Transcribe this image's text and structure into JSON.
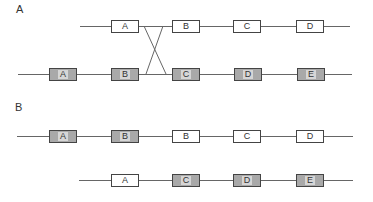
{
  "sections": [
    {
      "label": "A",
      "rows": [
        {
          "y": 26,
          "line": [
            80,
            350
          ],
          "boxes": [
            {
              "x": 111,
              "label": "A",
              "shaded": false
            },
            {
              "x": 172,
              "label": "B",
              "shaded": false
            },
            {
              "x": 233,
              "label": "C",
              "shaded": false
            },
            {
              "x": 296,
              "label": "D",
              "shaded": false
            }
          ]
        },
        {
          "y": 74,
          "line": [
            18,
            352
          ],
          "boxes": [
            {
              "x": 49,
              "label": "A",
              "shaded": true
            },
            {
              "x": 111,
              "label": "B",
              "shaded": true
            },
            {
              "x": 172,
              "label": "C",
              "shaded": true
            },
            {
              "x": 234,
              "label": "D",
              "shaded": true
            },
            {
              "x": 297,
              "label": "E",
              "shaded": true
            }
          ]
        }
      ],
      "crossover": {
        "top_y": 26,
        "bottom_y": 74,
        "lines": [
          [
            144,
            166
          ],
          [
            163,
            146
          ]
        ]
      }
    },
    {
      "label": "B",
      "rows": [
        {
          "y": 136,
          "line": [
            17,
            353
          ],
          "boxes": [
            {
              "x": 49,
              "label": "A",
              "shaded": true
            },
            {
              "x": 111,
              "label": "B",
              "shaded": true
            },
            {
              "x": 172,
              "label": "B",
              "shaded": false
            },
            {
              "x": 233,
              "label": "C",
              "shaded": false
            },
            {
              "x": 296,
              "label": "D",
              "shaded": false
            }
          ]
        },
        {
          "y": 180,
          "line": [
            79,
            353
          ],
          "boxes": [
            {
              "x": 111,
              "label": "A",
              "shaded": false
            },
            {
              "x": 172,
              "label": "C",
              "shaded": true
            },
            {
              "x": 233,
              "label": "D",
              "shaded": true
            },
            {
              "x": 296,
              "label": "E",
              "shaded": true
            }
          ]
        }
      ]
    }
  ],
  "colors": {
    "line": "#666666",
    "border": "#444444",
    "shaded_fill": "#a9a9a9",
    "plain_fill": "#ffffff"
  }
}
